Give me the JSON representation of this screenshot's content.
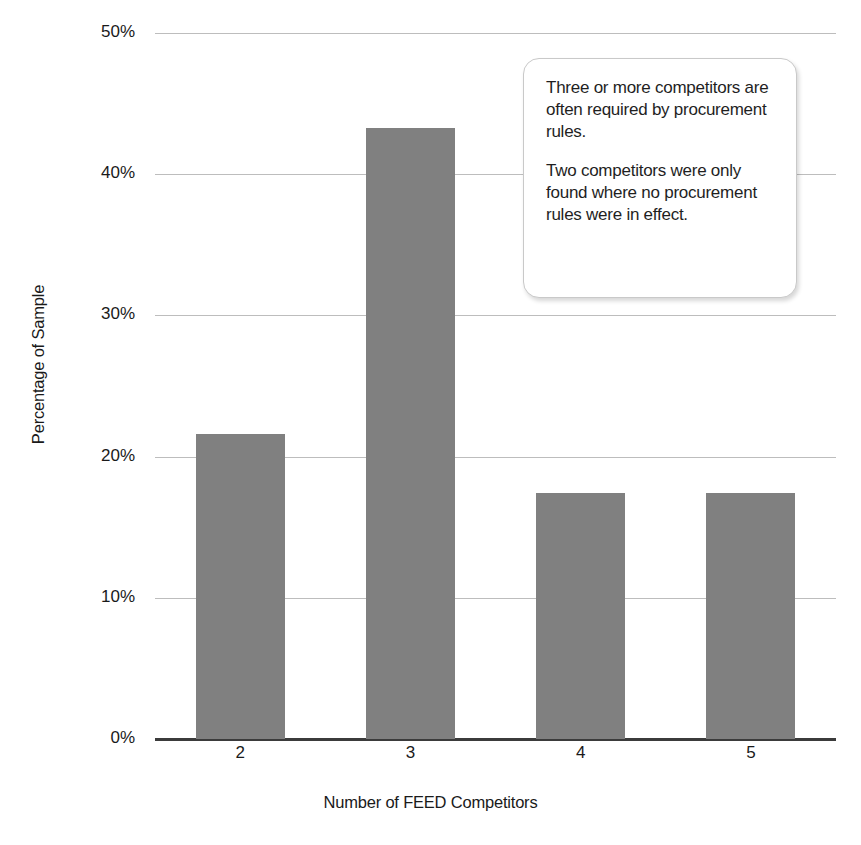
{
  "chart_data": {
    "type": "bar",
    "title": "",
    "categories": [
      "2",
      "3",
      "4",
      "5"
    ],
    "values": [
      21.6,
      43.3,
      17.4,
      17.4
    ],
    "value_suffix": "%",
    "xlabel": "Number of FEED Competitors",
    "ylabel": "Percentage of Sample",
    "ylim": [
      0,
      50
    ],
    "ytick_values": [
      0,
      10,
      20,
      30,
      40,
      50
    ],
    "ytick_labels": [
      "0%",
      "10%",
      "20%",
      "30%",
      "40%",
      "50%"
    ],
    "grid": true,
    "legend": false,
    "legend_position": "none",
    "bar_color": "#808080",
    "gridline_color": "#bdbdbd",
    "axis_color": "#3b3b3b",
    "annotations": [
      {
        "name": "callout-box",
        "lines": [
          "Three or more competitors are often required by procurement rules.",
          "Two competitors were only found where no procurement rules were in effect."
        ]
      }
    ]
  }
}
